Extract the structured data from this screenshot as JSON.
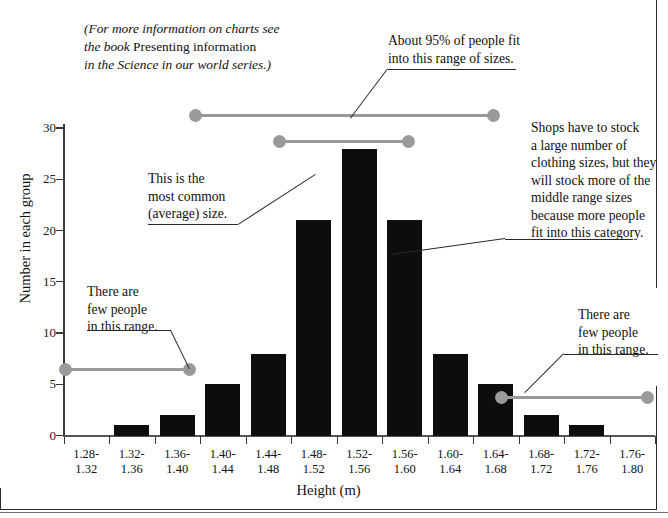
{
  "chart_data": {
    "type": "bar",
    "title": "",
    "xlabel": "Height (m)",
    "ylabel": "Number in each group",
    "categories": [
      "1.28-1.32",
      "1.32-1.36",
      "1.36-1.40",
      "1.40-1.44",
      "1.44-1.48",
      "1.48-1.52",
      "1.52-1.56",
      "1.56-1.60",
      "1.60-1.64",
      "1.64-1.68",
      "1.68-1.72",
      "1.72-1.76",
      "1.76-1.80"
    ],
    "category_lines": [
      [
        "1.28-",
        "1.32"
      ],
      [
        "1.32-",
        "1.36"
      ],
      [
        "1.36-",
        "1.40"
      ],
      [
        "1.40-",
        "1.44"
      ],
      [
        "1.44-",
        "1.48"
      ],
      [
        "1.48-",
        "1.52"
      ],
      [
        "1.52-",
        "1.56"
      ],
      [
        "1.56-",
        "1.60"
      ],
      [
        "1.60-",
        "1.64"
      ],
      [
        "1.64-",
        "1.68"
      ],
      [
        "1.68-",
        "1.72"
      ],
      [
        "1.72-",
        "1.76"
      ],
      [
        "1.76-",
        "1.80"
      ]
    ],
    "values": [
      0,
      1,
      2,
      5,
      8,
      21,
      28,
      21,
      8,
      5,
      2,
      1,
      0
    ],
    "ylim": [
      0,
      30
    ],
    "yticks": [
      0,
      5,
      10,
      15,
      20,
      25,
      30
    ],
    "ytick_labels": [
      "0",
      "5",
      "10",
      "15",
      "20",
      "25",
      "30"
    ],
    "grid": false,
    "legend": "none",
    "bar_color": "#0d0d0d",
    "range_marker_color": "#9a9a9a"
  },
  "axes": {
    "x_title": "Height (m)",
    "y_title": "Number in each group"
  },
  "range_markers": [
    {
      "name": "ninety-five-percent-range",
      "from_category": "1.36-1.40",
      "to_category": "1.68-1.72"
    },
    {
      "name": "middle-range-sizes",
      "from_category": "1.44-1.48",
      "to_category": "1.60-1.64"
    },
    {
      "name": "left-few-people-range",
      "from_category": "1.28-1.32",
      "to_category": "1.36-1.40"
    },
    {
      "name": "right-few-people-range",
      "from_category": "1.68-1.72",
      "to_category": "1.76-1.80"
    }
  ],
  "annotations": {
    "source_note": {
      "line1_italic": "(For more information on charts see",
      "line2_italic": "the book ",
      "line2_roman": "Presenting information",
      "line3_italic": "in the Science in our world series.)"
    },
    "ninety_five": {
      "line1": "About 95% of people fit",
      "line2": "into this range of sizes."
    },
    "shops": {
      "line1": "Shops have to stock",
      "line2": "a large number of",
      "line3": "clothing sizes, but they",
      "line4": "will stock more of the",
      "line5": "middle range sizes",
      "line6": "because more people",
      "line7": "fit into this category."
    },
    "most_common": {
      "line1": "This is the",
      "line2": "most common",
      "line3": "(average) size."
    },
    "few_left": {
      "line1": "There are",
      "line2": "few people",
      "line3": "in this range."
    },
    "few_right": {
      "line1": "There are",
      "line2": "few people",
      "line3": "in this range."
    }
  }
}
